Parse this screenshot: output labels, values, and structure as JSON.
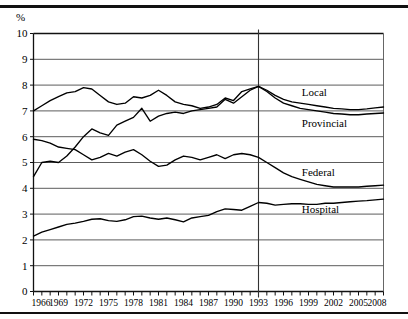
{
  "chart_data": {
    "type": "line",
    "title": "",
    "xlabel": "",
    "ylabel": "%",
    "ylim": [
      0,
      10
    ],
    "xlim": [
      1966,
      2008
    ],
    "grid": true,
    "legend_position": "inline-right",
    "y_ticks": [
      "0",
      "1",
      "2",
      "3",
      "4",
      "5",
      "6",
      "7",
      "8",
      "9",
      "10"
    ],
    "x_ticks": [
      "1966",
      "1969",
      "1972",
      "1975",
      "1978",
      "1981",
      "1984",
      "1987",
      "1990",
      "1993",
      "1996",
      "1999",
      "2002",
      "2005",
      "2008"
    ],
    "x_tick_step": 3,
    "x_minor_step": 1,
    "annotations": [
      {
        "name": "forecast-divider",
        "type": "vline",
        "x": 1993
      }
    ],
    "x": [
      1966,
      1967,
      1968,
      1969,
      1970,
      1971,
      1972,
      1973,
      1974,
      1975,
      1976,
      1977,
      1978,
      1979,
      1980,
      1981,
      1982,
      1983,
      1984,
      1985,
      1986,
      1987,
      1988,
      1989,
      1990,
      1991,
      1992,
      1993,
      1994,
      1995,
      1996,
      1997,
      1998,
      1999,
      2000,
      2001,
      2002,
      2003,
      2004,
      2005,
      2006,
      2007,
      2008
    ],
    "series": [
      {
        "name": "Local",
        "label": "Local",
        "values": [
          7.0,
          7.2,
          7.4,
          7.55,
          7.7,
          7.75,
          7.9,
          7.85,
          7.6,
          7.35,
          7.25,
          7.3,
          7.55,
          7.5,
          7.6,
          7.8,
          7.6,
          7.35,
          7.25,
          7.2,
          7.1,
          7.15,
          7.25,
          7.5,
          7.4,
          7.75,
          7.85,
          7.95,
          7.8,
          7.6,
          7.45,
          7.35,
          7.3,
          7.25,
          7.2,
          7.15,
          7.1,
          7.08,
          7.05,
          7.05,
          7.08,
          7.12,
          7.15
        ]
      },
      {
        "name": "Provincial",
        "label": "Provincial",
        "values": [
          4.45,
          5.0,
          5.05,
          5.0,
          5.25,
          5.6,
          6.0,
          6.3,
          6.15,
          6.05,
          6.45,
          6.6,
          6.75,
          7.1,
          6.6,
          6.8,
          6.9,
          6.95,
          6.9,
          7.0,
          7.05,
          7.1,
          7.15,
          7.45,
          7.3,
          7.55,
          7.8,
          7.95,
          7.75,
          7.5,
          7.3,
          7.2,
          7.1,
          7.05,
          7.0,
          6.95,
          6.9,
          6.88,
          6.85,
          6.85,
          6.88,
          6.9,
          6.92
        ]
      },
      {
        "name": "Federal",
        "label": "Federal",
        "values": [
          5.9,
          5.85,
          5.75,
          5.6,
          5.55,
          5.5,
          5.3,
          5.1,
          5.2,
          5.35,
          5.25,
          5.4,
          5.5,
          5.3,
          5.05,
          4.85,
          4.9,
          5.1,
          5.25,
          5.2,
          5.1,
          5.2,
          5.3,
          5.15,
          5.3,
          5.35,
          5.3,
          5.2,
          5.0,
          4.8,
          4.6,
          4.45,
          4.35,
          4.25,
          4.15,
          4.1,
          4.05,
          4.05,
          4.05,
          4.05,
          4.08,
          4.1,
          4.12
        ]
      },
      {
        "name": "Hospital",
        "label": "Hospital",
        "values": [
          2.15,
          2.3,
          2.4,
          2.5,
          2.6,
          2.65,
          2.72,
          2.8,
          2.82,
          2.75,
          2.72,
          2.78,
          2.9,
          2.92,
          2.85,
          2.8,
          2.85,
          2.78,
          2.7,
          2.85,
          2.9,
          2.95,
          3.1,
          3.2,
          3.18,
          3.15,
          3.3,
          3.45,
          3.42,
          3.35,
          3.38,
          3.4,
          3.4,
          3.38,
          3.38,
          3.42,
          3.42,
          3.45,
          3.48,
          3.5,
          3.52,
          3.55,
          3.58
        ]
      }
    ],
    "series_label_positions": [
      {
        "name": "Local",
        "x": 1998.2,
        "y": 7.72
      },
      {
        "name": "Provincial",
        "x": 1998.2,
        "y": 6.55
      },
      {
        "name": "Federal",
        "x": 1998.2,
        "y": 4.62
      },
      {
        "name": "Hospital",
        "x": 1998.2,
        "y": 3.18
      }
    ]
  }
}
